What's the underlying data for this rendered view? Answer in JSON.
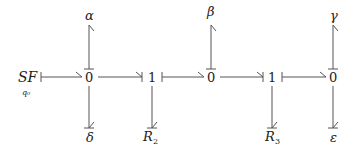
{
  "diagram": {
    "type": "bond-graph",
    "source": {
      "label": "SF",
      "subscript": "q₀"
    },
    "junctions": [
      {
        "id": "j1",
        "label": "0"
      },
      {
        "id": "j2",
        "label": "1"
      },
      {
        "id": "j3",
        "label": "0"
      },
      {
        "id": "j4",
        "label": "1"
      },
      {
        "id": "j5",
        "label": "0"
      }
    ],
    "elements": [
      {
        "id": "alpha",
        "label": "α",
        "attached_to": "j1",
        "position": "top"
      },
      {
        "id": "delta",
        "label": "δ",
        "attached_to": "j1",
        "position": "bottom"
      },
      {
        "id": "R2",
        "label": "R",
        "subscript": "2",
        "attached_to": "j2",
        "position": "bottom"
      },
      {
        "id": "beta",
        "label": "β",
        "attached_to": "j3",
        "position": "top"
      },
      {
        "id": "R3",
        "label": "R",
        "subscript": "3",
        "attached_to": "j4",
        "position": "bottom"
      },
      {
        "id": "gamma",
        "label": "γ",
        "attached_to": "j5",
        "position": "top"
      },
      {
        "id": "epsilon",
        "label": "ε",
        "attached_to": "j5",
        "position": "bottom"
      }
    ],
    "bonds": [
      {
        "from": "SF",
        "to": "j1",
        "half_arrow": "at j1",
        "causal_stroke": "at SF"
      },
      {
        "from": "j1",
        "to": "j2",
        "half_arrow": "at j2",
        "causal_stroke": "at j2"
      },
      {
        "from": "j2",
        "to": "j3",
        "half_arrow": "at j3",
        "causal_stroke": "at j2"
      },
      {
        "from": "j3",
        "to": "j4",
        "half_arrow": "at j4",
        "causal_stroke": "at j4"
      },
      {
        "from": "j4",
        "to": "j5",
        "half_arrow": "at j5",
        "causal_stroke": "at j4"
      },
      {
        "from": "j1",
        "to": "alpha",
        "half_arrow": "at alpha",
        "causal_stroke": "at j1"
      },
      {
        "from": "j1",
        "to": "delta",
        "half_arrow": "at delta",
        "causal_stroke": "at delta"
      },
      {
        "from": "j2",
        "to": "R2",
        "half_arrow": "at R2",
        "causal_stroke": "at R2"
      },
      {
        "from": "j3",
        "to": "beta",
        "half_arrow": "at beta",
        "causal_stroke": "at j3"
      },
      {
        "from": "j4",
        "to": "R3",
        "half_arrow": "at R3",
        "causal_stroke": "at R3"
      },
      {
        "from": "j5",
        "to": "gamma",
        "half_arrow": "at gamma",
        "causal_stroke": "at j5"
      },
      {
        "from": "j5",
        "to": "epsilon",
        "half_arrow": "at epsilon",
        "causal_stroke": "at epsilon"
      }
    ]
  }
}
